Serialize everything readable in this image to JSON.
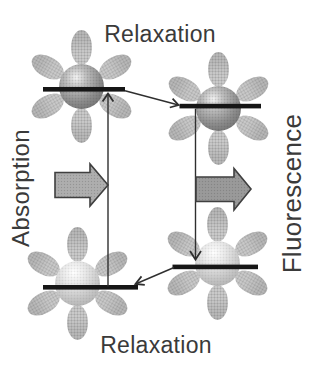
{
  "labels": {
    "relaxation_top": "Relaxation",
    "relaxation_bottom": "Relaxation",
    "absorption": "Absorption",
    "fluorescence": "Fluorescence"
  },
  "molecules": [
    {
      "position": "top-left",
      "state": "excited"
    },
    {
      "position": "top-right",
      "state": "excited"
    },
    {
      "position": "bottom-left",
      "state": "ground"
    },
    {
      "position": "bottom-right",
      "state": "ground"
    }
  ],
  "colors": {
    "background": "#ffffff",
    "text": "#3a3a3a",
    "petal": "#c9c9c9",
    "petal_tip": "#b7b7b7",
    "bar": "#161616",
    "thin_arrow": "#2f2f2f",
    "block_arrow_left": "#aeaeae",
    "block_arrow_right": "#9a9a9a",
    "block_arrow_outline": "#3f3f3f",
    "sphere_excited": "#6e6e6e",
    "sphere_ground": "#a8a8a8"
  }
}
